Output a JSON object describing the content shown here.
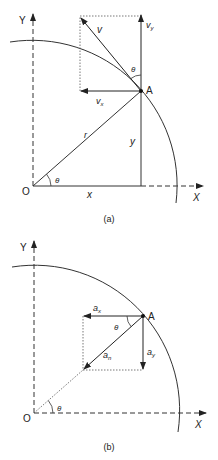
{
  "figure_a": {
    "caption": "(a)",
    "axis_y": "Y",
    "axis_x": "X",
    "origin": "O",
    "point": "A",
    "radius": "r",
    "x_label": "x",
    "y_label": "y",
    "theta_origin": "θ",
    "theta_a": "θ",
    "velocity": "v",
    "vx_main": "v",
    "vx_sub": "x",
    "vy_main": "v",
    "vy_sub": "y"
  },
  "figure_b": {
    "caption": "(b)",
    "axis_y": "Y",
    "axis_x": "X",
    "origin": "O",
    "point": "A",
    "theta_origin": "θ",
    "theta_a": "θ",
    "ax_main": "a",
    "ax_sub": "x",
    "ay_main": "a",
    "ay_sub": "y",
    "an_main": "a",
    "an_sub": "n"
  }
}
